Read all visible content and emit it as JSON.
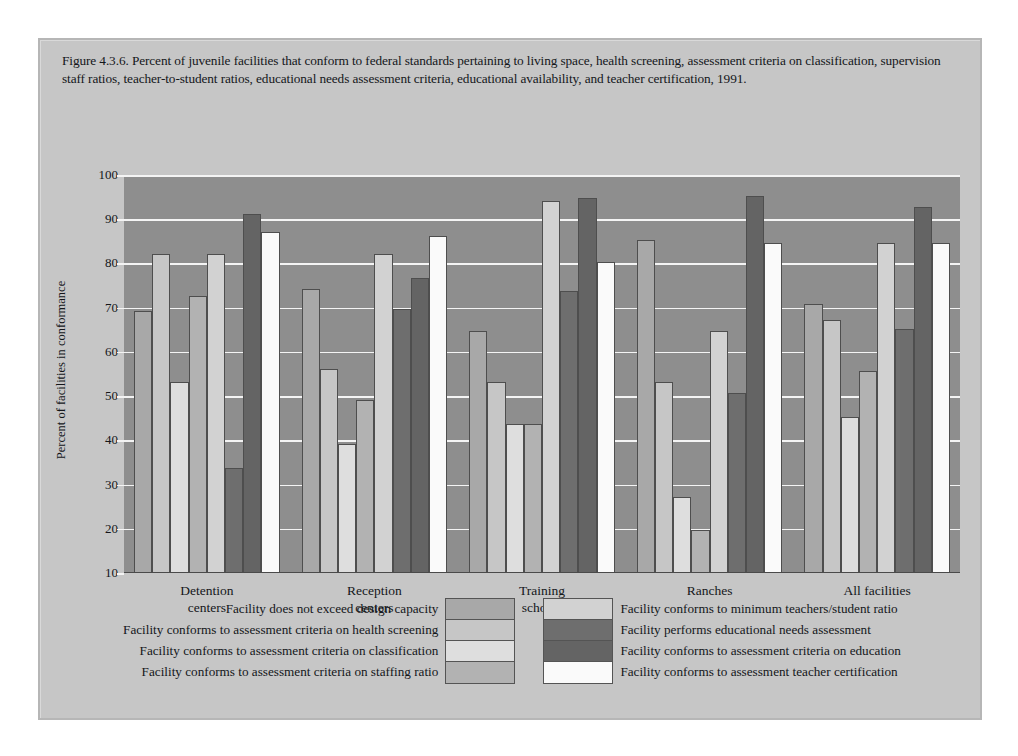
{
  "figure": {
    "caption": "Figure 4.3.6. Percent of juvenile facilities that conform to federal standards pertaining to living space, health screening, assessment criteria on classification, supervision staff ratios, teacher-to-student ratios, educational needs assessment criteria, educational availability, and teacher certification, 1991."
  },
  "chart_data": {
    "type": "bar",
    "title": "Figure 4.3.6. Percent of juvenile facilities that conform to federal standards pertaining to living space, health screening, assessment criteria on classification, supervision staff ratios, teacher-to-student ratios, educational needs assessment criteria, educational availability, and teacher certification, 1991.",
    "xlabel": "",
    "ylabel": "Percent of facilities in conformance",
    "ylim": [
      10,
      100
    ],
    "yticks": [
      10,
      20,
      30,
      40,
      50,
      60,
      70,
      80,
      90,
      100
    ],
    "grid": true,
    "legend_position": "bottom",
    "categories": [
      "Detention centers",
      "Reception centers",
      "Training schools",
      "Ranches",
      "All facilities"
    ],
    "categories_lines": [
      [
        "Detention",
        "centers"
      ],
      [
        "Reception",
        "centers"
      ],
      [
        "Training",
        "schools"
      ],
      [
        "Ranches",
        ""
      ],
      [
        "All facilities",
        ""
      ]
    ],
    "series": [
      {
        "name": "Facility does not exceed design capacity",
        "color": "#a8a8a8",
        "values": [
          69.0,
          74.0,
          64.5,
          85.0,
          70.5
        ]
      },
      {
        "name": "Facility conforms to assessment criteria on health screening",
        "color": "#c6c6c6",
        "values": [
          82.0,
          56.0,
          53.0,
          53.0,
          67.0
        ]
      },
      {
        "name": "Facility conforms to assessment criteria on classification",
        "color": "#dedede",
        "values": [
          53.0,
          39.0,
          43.5,
          27.0,
          45.0
        ]
      },
      {
        "name": "Facility conforms to assessment criteria on staffing ratio",
        "color": "#b2b2b2",
        "values": [
          72.5,
          49.0,
          43.5,
          19.5,
          55.5
        ]
      },
      {
        "name": "Facility conforms to minimum teachers/student ratio",
        "color": "#d2d2d2",
        "values": [
          82.0,
          82.0,
          94.0,
          64.5,
          84.5
        ]
      },
      {
        "name": "Facility performs educational needs assessment",
        "color": "#6e6e6e",
        "values": [
          33.5,
          69.5,
          73.5,
          50.5,
          65.0
        ]
      },
      {
        "name": "Facility conforms to assessment criteria on education",
        "color": "#646464",
        "values": [
          91.0,
          76.5,
          94.5,
          95.0,
          92.5
        ]
      },
      {
        "name": "Facility conforms to assessment teacher certification",
        "color": "#fafafa",
        "values": [
          87.0,
          86.0,
          80.0,
          84.5,
          84.5
        ]
      }
    ]
  },
  "legend": {
    "left_items": [
      {
        "label": "Facility does not exceed design capacity",
        "color": "#a8a8a8"
      },
      {
        "label": "Facility conforms to assessment criteria on health screening",
        "color": "#c6c6c6"
      },
      {
        "label": "Facility conforms to assessment criteria on classification",
        "color": "#dedede"
      },
      {
        "label": "Facility conforms to assessment criteria on staffing ratio",
        "color": "#b2b2b2"
      }
    ],
    "right_items": [
      {
        "label": "Facility conforms to minimum teachers/student ratio",
        "color": "#d2d2d2"
      },
      {
        "label": "Facility performs educational needs assessment",
        "color": "#6e6e6e"
      },
      {
        "label": "Facility conforms to assessment criteria on education",
        "color": "#646464"
      },
      {
        "label": "Facility conforms to assessment teacher certification",
        "color": "#fafafa"
      }
    ]
  },
  "style": {
    "page_background": "#ffffff",
    "card_background": "#c6c6c6",
    "plot_background": "#8e8e8e",
    "gridline_color": "#f4f4f4",
    "text_color": "#14161a",
    "bar_outline": "#4e4e4e"
  }
}
